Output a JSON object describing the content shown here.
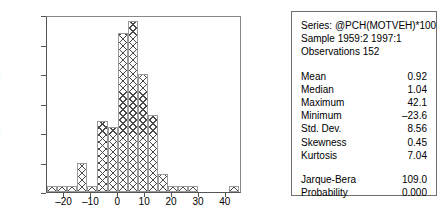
{
  "chart_data": {
    "type": "bar",
    "title": "",
    "xlabel": "",
    "ylabel": "",
    "grid": false,
    "legend_position": "none",
    "xlim": [
      -26.5,
      46.0
    ],
    "ylim": [
      0,
      30
    ],
    "ytick_labels": [
      "0",
      "5",
      "10",
      "15",
      "20",
      "25",
      "30"
    ],
    "ytick_values": [
      0,
      5,
      10,
      15,
      20,
      25,
      30
    ],
    "xtick_labels": [
      "-20",
      "-10",
      "0",
      "10",
      "20",
      "30",
      "40"
    ],
    "xtick_values": [
      -20,
      -10,
      0,
      10,
      20,
      30,
      40
    ],
    "bin_width": 3.75,
    "bin_starts": [
      -26.5,
      -22.75,
      -19.0,
      -15.25,
      -11.5,
      -7.75,
      -4.0,
      -0.25,
      3.5,
      7.25,
      11.0,
      14.75,
      18.5,
      22.25,
      26.0,
      29.75,
      33.5,
      37.25,
      41.0
    ],
    "categories": [
      "-26.5",
      "-22.75",
      "-19.0",
      "-15.25",
      "-11.5",
      "-7.75",
      "-4.0",
      "-0.25",
      "3.5",
      "7.25",
      "11.0",
      "14.75",
      "18.5",
      "22.25",
      "26.0",
      "29.75",
      "33.5",
      "37.25",
      "41.0"
    ],
    "values": [
      1,
      1,
      1,
      5,
      1,
      12,
      11,
      27,
      29,
      20,
      13,
      3,
      1,
      1,
      1,
      0,
      0,
      0,
      1
    ]
  },
  "stats": {
    "header": {
      "series_line": "Series: @PCH(MOTVEH)*100",
      "sample_line": "Sample 1959:2 1997:1",
      "observations_line": "Observations 152"
    },
    "rows": [
      {
        "label": "Mean",
        "value": "0.92"
      },
      {
        "label": "Median",
        "value": "1.04"
      },
      {
        "label": "Maximum",
        "value": "42.1"
      },
      {
        "label": "Minimum",
        "value": "–23.6"
      },
      {
        "label": "Std. Dev.",
        "value": "8.56"
      },
      {
        "label": "Skewness",
        "value": "0.45"
      },
      {
        "label": "Kurtosis",
        "value": "7.04"
      }
    ],
    "test_rows": [
      {
        "label": "Jarque-Bera",
        "value": "109.0"
      },
      {
        "label": "Probability",
        "value": "0.000"
      }
    ]
  }
}
